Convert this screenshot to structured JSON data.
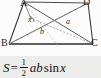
{
  "figure": {
    "type": "geometry-quadrilateral-with-diagonals",
    "vertices": [
      {
        "name": "A",
        "label": "A",
        "x": 24,
        "y": 2
      },
      {
        "name": "B",
        "label": "B",
        "x": 9,
        "y": 44
      },
      {
        "name": "C",
        "label": "C",
        "x": 93,
        "y": 44
      },
      {
        "name": "D",
        "label": "D",
        "x": 88,
        "y": 3
      }
    ],
    "segment_labels": [
      {
        "name": "angle-x",
        "label": "x"
      },
      {
        "name": "diagonal-a",
        "label": "a"
      },
      {
        "name": "diagonal-b",
        "label": "b"
      }
    ],
    "line_color": "#3a3a3a",
    "dashed_color": "#8a8a8a"
  },
  "formula": {
    "area_symbol": "S",
    "equals": "=",
    "numerator": "1",
    "denominator": "2",
    "factors": "ab",
    "function": "sin",
    "argument": "x",
    "full_text": "S = 1/2 ab sin x",
    "band_color": "#ececeb"
  }
}
